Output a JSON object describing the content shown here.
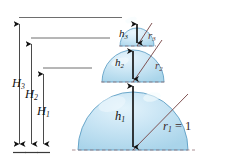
{
  "figure": {
    "colors": {
      "sphere_fill": "#b9dcee",
      "sphere_fill_light": "#d3eaf6",
      "sphere_edge": "#5d9ec4",
      "radius_line": "#7a4a4a",
      "arrow": "#1a1a1a",
      "guide_line": "#555555",
      "dashed_line": "#8a6a6a",
      "background": "#ffffff"
    },
    "heights": [
      {
        "id": "H1",
        "label": "H",
        "sub": "1"
      },
      {
        "id": "H2",
        "label": "H",
        "sub": "2"
      },
      {
        "id": "H3",
        "label": "H",
        "sub": "3"
      }
    ],
    "segments": [
      {
        "id": "h1",
        "label": "h",
        "sub": "1"
      },
      {
        "id": "h2",
        "label": "h",
        "sub": "2"
      },
      {
        "id": "h3",
        "label": "h",
        "sub": "3"
      }
    ],
    "radii": [
      {
        "id": "r1",
        "label": "r",
        "sub": "1",
        "equals": " = 1",
        "value": "1"
      },
      {
        "id": "r2",
        "label": "r",
        "sub": "2",
        "equals": "",
        "value": ""
      },
      {
        "id": "r3",
        "label": "r",
        "sub": "3",
        "equals": "",
        "value": ""
      }
    ],
    "labels": {
      "H1": "H",
      "H1_sub": "1",
      "H2": "H",
      "H2_sub": "2",
      "H3": "H",
      "H3_sub": "3",
      "h1": "h",
      "h1_sub": "1",
      "h2": "h",
      "h2_sub": "2",
      "h3": "h",
      "h3_sub": "3",
      "r1": "r",
      "r1_sub": "1",
      "r1_eq": " = 1",
      "r2": "r",
      "r2_sub": "2",
      "r3": "r",
      "r3_sub": "3"
    }
  }
}
